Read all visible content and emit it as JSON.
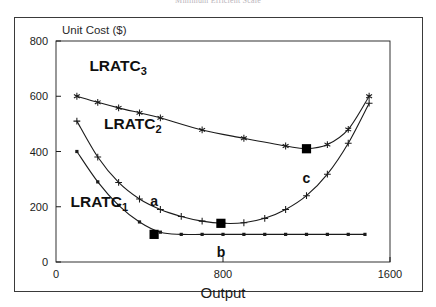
{
  "figure": {
    "title": "Minimum Efficient Scale",
    "frame_color": "#3a3a3a",
    "background": "#ffffff",
    "line_color": "#1b1b1b"
  },
  "chart_data": {
    "type": "line",
    "title": "Minimum Efficient Scale",
    "xlabel": "Output",
    "ylabel": "Unit Cost ($)",
    "xlim": [
      0,
      1600
    ],
    "ylim": [
      0,
      800
    ],
    "xticks": [
      0,
      800,
      1600
    ],
    "yticks": [
      0,
      200,
      400,
      600,
      800
    ],
    "xticklabels": [
      "0",
      "800",
      "1600"
    ],
    "yticklabels": [
      "0",
      "200",
      "400",
      "600",
      "800"
    ],
    "grid": false,
    "legend": "inline-curve-labels",
    "series": [
      {
        "name": "LRATC_1",
        "label": "LRATC",
        "subscript": "1",
        "marker": "small-filled-square",
        "label_x": 70,
        "label_y": 200,
        "points": [
          {
            "x": 100,
            "y": 400
          },
          {
            "x": 200,
            "y": 290
          },
          {
            "x": 300,
            "y": 205
          },
          {
            "x": 400,
            "y": 145
          },
          {
            "x": 500,
            "y": 108
          },
          {
            "x": 600,
            "y": 100
          },
          {
            "x": 700,
            "y": 100
          },
          {
            "x": 800,
            "y": 100
          },
          {
            "x": 900,
            "y": 100
          },
          {
            "x": 1000,
            "y": 100
          },
          {
            "x": 1100,
            "y": 100
          },
          {
            "x": 1200,
            "y": 100
          },
          {
            "x": 1300,
            "y": 100
          },
          {
            "x": 1400,
            "y": 100
          },
          {
            "x": 1480,
            "y": 100
          }
        ]
      },
      {
        "name": "LRATC_2",
        "label": "LRATC",
        "subscript": "2",
        "marker": "plus",
        "label_x": 230,
        "label_y": 480,
        "points": [
          {
            "x": 100,
            "y": 510
          },
          {
            "x": 200,
            "y": 380
          },
          {
            "x": 300,
            "y": 288
          },
          {
            "x": 400,
            "y": 228
          },
          {
            "x": 500,
            "y": 190
          },
          {
            "x": 600,
            "y": 165
          },
          {
            "x": 700,
            "y": 148
          },
          {
            "x": 800,
            "y": 140
          },
          {
            "x": 900,
            "y": 142
          },
          {
            "x": 1000,
            "y": 158
          },
          {
            "x": 1100,
            "y": 190
          },
          {
            "x": 1200,
            "y": 240
          },
          {
            "x": 1300,
            "y": 318
          },
          {
            "x": 1400,
            "y": 430
          },
          {
            "x": 1500,
            "y": 575
          }
        ]
      },
      {
        "name": "LRATC_3",
        "label": "LRATC",
        "subscript": "3",
        "marker": "asterisk",
        "label_x": 160,
        "label_y": 690,
        "points": [
          {
            "x": 100,
            "y": 600
          },
          {
            "x": 200,
            "y": 578
          },
          {
            "x": 300,
            "y": 558
          },
          {
            "x": 400,
            "y": 540
          },
          {
            "x": 500,
            "y": 522
          },
          {
            "x": 700,
            "y": 478
          },
          {
            "x": 900,
            "y": 448
          },
          {
            "x": 1100,
            "y": 420
          },
          {
            "x": 1200,
            "y": 410
          },
          {
            "x": 1300,
            "y": 425
          },
          {
            "x": 1400,
            "y": 480
          },
          {
            "x": 1500,
            "y": 600
          }
        ]
      }
    ],
    "annotations": [
      {
        "label": "a",
        "x": 470,
        "y": 100,
        "marker": "big-filled-square",
        "label_offset_y": -28
      },
      {
        "label": "b",
        "x": 790,
        "y": 140,
        "marker": "big-filled-square",
        "label_offset_y": 34
      },
      {
        "label": "c",
        "x": 1200,
        "y": 410,
        "marker": "big-filled-square",
        "label_offset_y": 34
      }
    ]
  }
}
